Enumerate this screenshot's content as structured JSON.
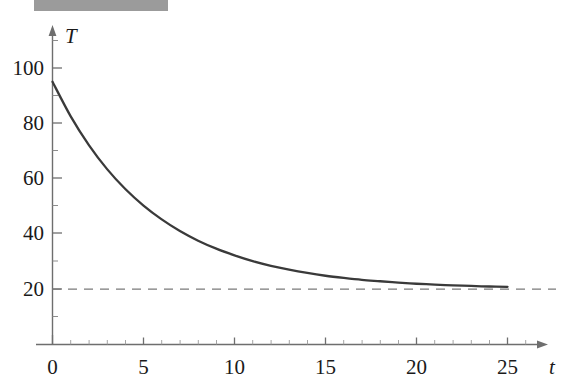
{
  "figure": {
    "caption_strip_text": "",
    "background_color": "#ffffff",
    "axis_color": "#6e6e6e",
    "curve_color": "#3a3a3a",
    "asymptote_color": "#7a7a7a"
  },
  "chart_data": {
    "type": "line",
    "title": "",
    "xlabel": "t",
    "ylabel": "T",
    "xlim": [
      -0.4,
      28.3
    ],
    "ylim": [
      -13,
      110
    ],
    "grid": false,
    "legend": null,
    "x_ticks_major": [
      0,
      5,
      10,
      15,
      20,
      25
    ],
    "x_tick_labels": [
      "0",
      "5",
      "10",
      "15",
      "20",
      "25"
    ],
    "x_minor_tick_step": 1,
    "y_ticks_major": [
      20,
      40,
      60,
      80,
      100
    ],
    "y_tick_labels": [
      "20",
      "40",
      "60",
      "80",
      "100"
    ],
    "y_minor_tick_step": 5,
    "series": [
      {
        "name": "T(t)",
        "style": "solid",
        "model": "20 + 75*exp(-0.1823*t)",
        "x": [
          0,
          1,
          2,
          3,
          4,
          5,
          6,
          7,
          8,
          9,
          10,
          11,
          12,
          13,
          14,
          15,
          16,
          17,
          18,
          19,
          20,
          21,
          22,
          23,
          24,
          25
        ],
        "y": [
          95.0,
          82.5,
          72.1,
          63.4,
          56.2,
          50.2,
          45.2,
          41.0,
          37.5,
          34.6,
          32.2,
          30.1,
          28.4,
          27.0,
          25.8,
          24.8,
          24.0,
          23.3,
          22.8,
          22.3,
          21.9,
          21.6,
          21.3,
          21.1,
          20.9,
          20.8
        ]
      },
      {
        "name": "asymptote",
        "style": "dashed",
        "value": 20,
        "x": [
          0,
          28
        ],
        "y": [
          20,
          20
        ]
      }
    ],
    "annotations": []
  }
}
